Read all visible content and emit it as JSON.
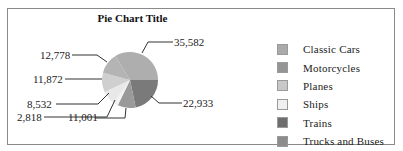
{
  "chart_data": {
    "type": "pie",
    "title": "Pie Chart Title",
    "legend_position": "right",
    "categories": [
      "Classic Cars",
      "Motorcycles",
      "Planes",
      "Ships",
      "Trains",
      "Trucks and Buses"
    ],
    "slices": [
      {
        "label": "Trains",
        "value": 22933,
        "color": "#7a7a7a"
      },
      {
        "label": "Trucks and Buses",
        "value": 11001,
        "color": "#9a9a9a"
      },
      {
        "label": "",
        "value": 2818,
        "color": "#f2f2f2"
      },
      {
        "label": "Ships",
        "value": 8532,
        "color": "#e8e8e8"
      },
      {
        "label": "Planes",
        "value": 11872,
        "color": "#cfcfcf"
      },
      {
        "label": "Motorcycles",
        "value": 12778,
        "color": "#b4b4b4"
      },
      {
        "label": "Classic Cars",
        "value": 35582,
        "color": "#aeaeae"
      }
    ],
    "data_labels": [
      "22,933",
      "11,001",
      "2,818",
      "8,532",
      "11,872",
      "12,778",
      "35,582"
    ]
  },
  "legend": {
    "items": [
      {
        "label": "Classic Cars",
        "color": "#aaaaaa"
      },
      {
        "label": "Motorcycles",
        "color": "#959595"
      },
      {
        "label": "Planes",
        "color": "#c8c8c8"
      },
      {
        "label": "Ships",
        "color": "#f0f0f0"
      },
      {
        "label": "Trains",
        "color": "#6e6e6e"
      },
      {
        "label": "Trucks and Buses",
        "color": "#8c8c8c"
      }
    ]
  }
}
